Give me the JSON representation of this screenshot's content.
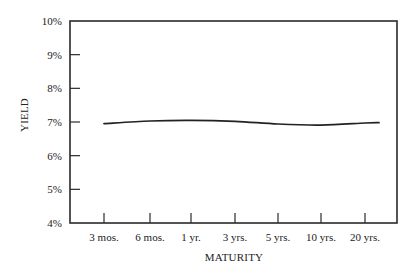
{
  "chart_data": {
    "type": "line",
    "title": "",
    "xlabel": "MATURITY",
    "ylabel": "YIELD",
    "categories": [
      "3 mos.",
      "6 mos.",
      "1 yr.",
      "3 yrs.",
      "5 yrs.",
      "10 yrs.",
      "20 yrs."
    ],
    "series": [
      {
        "name": "Yield curve",
        "values": [
          6.95,
          7.03,
          7.05,
          7.02,
          6.94,
          6.91,
          6.97
        ]
      }
    ],
    "y_ticks": [
      "4%",
      "5%",
      "6%",
      "7%",
      "8%",
      "9%",
      "10%"
    ],
    "ylim": [
      4,
      10
    ],
    "grid": false,
    "legend": "none",
    "line_color": "#222222"
  }
}
